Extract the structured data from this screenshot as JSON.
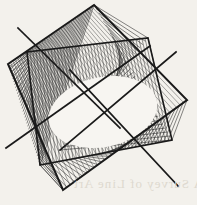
{
  "figure": {
    "title": "Line-envelope string art figure",
    "type": "geometric-line-envelope",
    "canvas": {
      "width": 197,
      "height": 205
    },
    "background_color": "#f3f1ec",
    "ink_color": "#1a1a1a",
    "thin_line_color": "#2b2b2b",
    "outer_square": {
      "label": "rotated square frame",
      "stroke_width": 2.0,
      "vertices": [
        {
          "name": "top",
          "x": 94,
          "y": 5
        },
        {
          "name": "right",
          "x": 187,
          "y": 100
        },
        {
          "name": "bottom",
          "x": 63,
          "y": 190
        },
        {
          "name": "left",
          "x": 8,
          "y": 64
        }
      ]
    },
    "inner_square": {
      "label": "second rotated square frame",
      "stroke_width": 1.6,
      "vertices": [
        {
          "name": "top-right",
          "x": 148,
          "y": 38
        },
        {
          "name": "bottom-right",
          "x": 172,
          "y": 140
        },
        {
          "name": "bottom-left",
          "x": 40,
          "y": 165
        },
        {
          "name": "top-left",
          "x": 27,
          "y": 52
        }
      ]
    },
    "crossing_lines": [
      {
        "name": "diagonal-upper-left",
        "x1": 18,
        "y1": 28,
        "x2": 120,
        "y2": 128
      },
      {
        "name": "diagonal-upper-right",
        "x1": 176,
        "y1": 52,
        "x2": 60,
        "y2": 150
      },
      {
        "name": "diagonal-lower-left",
        "x1": 6,
        "y1": 148,
        "x2": 150,
        "y2": 46
      },
      {
        "name": "diagonal-lower-right",
        "x1": 178,
        "y1": 186,
        "x2": 70,
        "y2": 70
      }
    ],
    "line_families": [
      {
        "name": "family-top-left",
        "count": 34,
        "from": {
          "x1": 27,
          "y1": 52,
          "x2": 94,
          "y2": 5
        },
        "to": {
          "x1": 8,
          "y1": 64,
          "x2": 40,
          "y2": 165
        },
        "stroke_width": 0.55,
        "color": "#232323"
      },
      {
        "name": "family-top-right",
        "count": 34,
        "from": {
          "x1": 94,
          "y1": 5,
          "x2": 172,
          "y2": 140
        },
        "to": {
          "x1": 148,
          "y1": 38,
          "x2": 60,
          "y2": 150
        },
        "stroke_width": 0.55,
        "color": "#232323"
      },
      {
        "name": "family-right-lower",
        "count": 32,
        "from": {
          "x1": 187,
          "y1": 100,
          "x2": 63,
          "y2": 190
        },
        "to": {
          "x1": 172,
          "y1": 140,
          "x2": 40,
          "y2": 165
        },
        "stroke_width": 0.55,
        "color": "#232323"
      },
      {
        "name": "family-bottom-left",
        "count": 32,
        "from": {
          "x1": 63,
          "y1": 190,
          "x2": 8,
          "y2": 64
        },
        "to": {
          "x1": 40,
          "y1": 165,
          "x2": 27,
          "y2": 52
        },
        "stroke_width": 0.55,
        "color": "#232323"
      },
      {
        "name": "family-inner-cardioid",
        "count": 40,
        "from": {
          "x1": 148,
          "y1": 38,
          "x2": 27,
          "y2": 52
        },
        "to": {
          "x1": 172,
          "y1": 140,
          "x2": 40,
          "y2": 165
        },
        "stroke_width": 0.5,
        "color": "#2b2b2b"
      },
      {
        "name": "family-cross-hatch",
        "count": 36,
        "from": {
          "x1": 8,
          "y1": 64,
          "x2": 94,
          "y2": 5
        },
        "to": {
          "x1": 63,
          "y1": 190,
          "x2": 187,
          "y2": 100
        },
        "stroke_width": 0.45,
        "color": "#3a3a3a"
      }
    ],
    "central_void": {
      "label": "white oval envelope region",
      "cx": 103,
      "cy": 112,
      "rx": 55,
      "ry": 35,
      "rotation_deg": -12,
      "fill": "#f7f5f1"
    }
  },
  "ghost_text": {
    "label": "faint show-through text from reverse page",
    "line1": "A Survey of Line Art",
    "top": 176,
    "left": 6
  }
}
